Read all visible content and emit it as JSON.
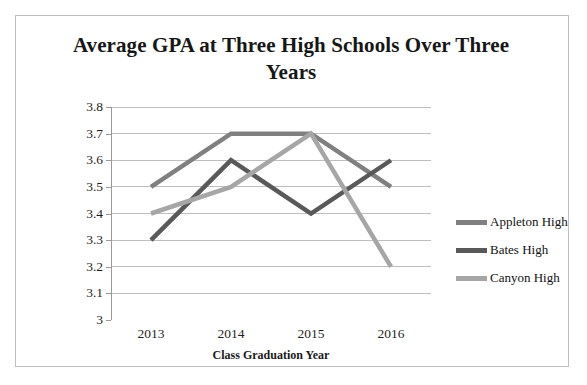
{
  "chart_data": {
    "type": "line",
    "title": "Average GPA at Three High Schools Over Three Years",
    "xlabel": "Class Graduation Year",
    "ylabel": "Average GPA of Graduating Senior",
    "categories": [
      "2013",
      "2014",
      "2015",
      "2016"
    ],
    "ylim": [
      3,
      3.8
    ],
    "ytick_labels": [
      "3.8",
      "3.7",
      "3.6",
      "3.5",
      "3.4",
      "3.3",
      "3.2",
      "3.1",
      "3"
    ],
    "ytick_values": [
      3.8,
      3.7,
      3.6,
      3.5,
      3.4,
      3.3,
      3.2,
      3.1,
      3.0
    ],
    "grid": "horizontal",
    "legend_position": "right",
    "series": [
      {
        "name": "Appleton High",
        "color": "#808080",
        "values": [
          3.5,
          3.7,
          3.7,
          3.5
        ]
      },
      {
        "name": "Bates High",
        "color": "#595959",
        "values": [
          3.3,
          3.6,
          3.4,
          3.6
        ]
      },
      {
        "name": "Canyon High",
        "color": "#a6a6a6",
        "values": [
          3.4,
          3.5,
          3.7,
          3.2
        ]
      }
    ]
  }
}
